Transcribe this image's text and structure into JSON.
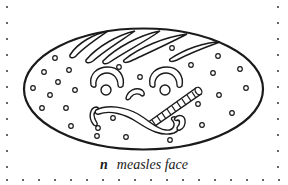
{
  "figure": {
    "letter": "n",
    "caption": "measles face",
    "ink_color": "#1a1a1a",
    "background": "#ffffff"
  },
  "border": {
    "dot_spacing": 16,
    "left_x": 7,
    "right_x": 278,
    "bottom_y": 180,
    "top_y": 7
  },
  "spots": [
    [
      55,
      58
    ],
    [
      69,
      70
    ],
    [
      44,
      72
    ],
    [
      58,
      82
    ],
    [
      33,
      88
    ],
    [
      50,
      95
    ],
    [
      75,
      90
    ],
    [
      42,
      108
    ],
    [
      66,
      108
    ],
    [
      71,
      126
    ],
    [
      97,
      136
    ],
    [
      126,
      137
    ],
    [
      170,
      140
    ],
    [
      119,
      67
    ],
    [
      140,
      77
    ],
    [
      172,
      48
    ],
    [
      191,
      65
    ],
    [
      218,
      56
    ],
    [
      213,
      73
    ],
    [
      240,
      69
    ],
    [
      246,
      88
    ],
    [
      219,
      95
    ],
    [
      198,
      104
    ],
    [
      232,
      113
    ],
    [
      202,
      125
    ],
    [
      113,
      118
    ],
    [
      98,
      128
    ]
  ]
}
